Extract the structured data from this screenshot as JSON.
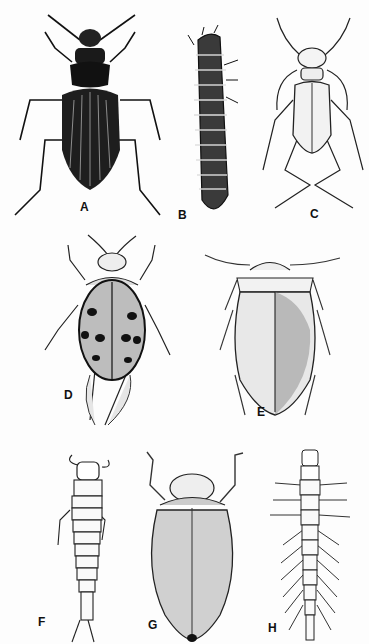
{
  "plate": {
    "figures": [
      {
        "label": "A",
        "subject": "ground beetle (adult)",
        "label_pos": [
          80,
          201
        ]
      },
      {
        "label": "B",
        "subject": "beetle larva (segmented, spiny)",
        "label_pos": [
          178,
          209
        ]
      },
      {
        "label": "C",
        "subject": "tiger beetle (adult)",
        "label_pos": [
          310,
          208
        ]
      },
      {
        "label": "D",
        "subject": "spotted water beetle (adult)",
        "label_pos": [
          64,
          389
        ]
      },
      {
        "label": "E",
        "subject": "diving beetle (adult)",
        "label_pos": [
          257,
          406
        ]
      },
      {
        "label": "F",
        "subject": "aquatic beetle larva",
        "label_pos": [
          38,
          616
        ]
      },
      {
        "label": "G",
        "subject": "water scavenger beetle (adult)",
        "label_pos": [
          148,
          619
        ]
      },
      {
        "label": "H",
        "subject": "whirligig beetle larva",
        "label_pos": [
          268,
          622
        ]
      }
    ],
    "colors": {
      "ink": "#111111",
      "paper": "#fdfdfd",
      "shade": "#555555"
    }
  }
}
